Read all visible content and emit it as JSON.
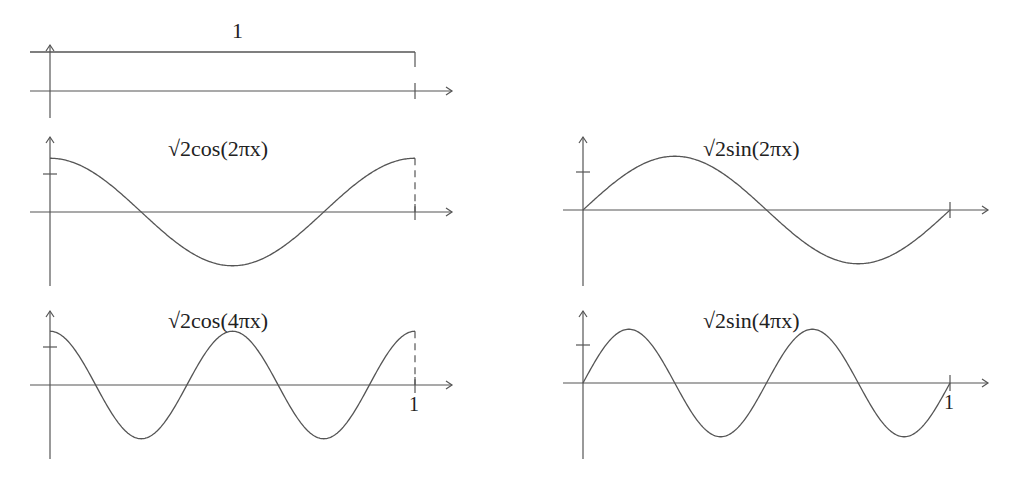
{
  "chart_data": [
    {
      "type": "line",
      "title": "1",
      "function": "constant",
      "amp": 1,
      "freq": 0,
      "trig": "const",
      "xlim": [
        0,
        1
      ],
      "ylim": [
        -0.5,
        1
      ],
      "layout": {
        "x0": 50,
        "x1": 415,
        "axisY": 91,
        "unit": 39,
        "arrowEnd": 452,
        "yTop": 45,
        "yBot": 118,
        "tickY": false,
        "label1": false,
        "titleX": 232,
        "titleY": 18
      }
    },
    {
      "type": "line",
      "title": "√2cos(2πx)",
      "function": "sqrt2*cos(2*pi*x)",
      "amp": 1.4142,
      "freq": 2,
      "trig": "cos",
      "xlim": [
        0,
        1
      ],
      "ylim": [
        -1.5,
        1.5
      ],
      "layout": {
        "x0": 50,
        "x1": 415,
        "axisY": 212,
        "unit": 38,
        "arrowEnd": 452,
        "yTop": 137,
        "yBot": 286,
        "tickY": true,
        "label1": false,
        "titleX": 168,
        "titleY": 136
      }
    },
    {
      "type": "line",
      "title": "√2sin(2πx)",
      "function": "sqrt2*sin(2*pi*x)",
      "amp": 1.4142,
      "freq": 2,
      "trig": "sin",
      "xlim": [
        0,
        1
      ],
      "ylim": [
        -1.5,
        1.5
      ],
      "layout": {
        "x0": 583,
        "x1": 950,
        "axisY": 210,
        "unit": 38,
        "arrowEnd": 988,
        "yTop": 137,
        "yBot": 286,
        "tickY": true,
        "label1": false,
        "titleX": 703,
        "titleY": 136
      }
    },
    {
      "type": "line",
      "title": "√2cos(4πx)",
      "function": "sqrt2*cos(4*pi*x)",
      "amp": 1.4142,
      "freq": 4,
      "trig": "cos",
      "xlim": [
        0,
        1
      ],
      "ylim": [
        -1.5,
        1.5
      ],
      "layout": {
        "x0": 50,
        "x1": 415,
        "axisY": 385,
        "unit": 38,
        "arrowEnd": 452,
        "yTop": 311,
        "yBot": 459,
        "tickY": true,
        "label1": true,
        "titleX": 168,
        "titleY": 308
      }
    },
    {
      "type": "line",
      "title": "√2sin(4πx)",
      "function": "sqrt2*sin(4*pi*x)",
      "amp": 1.4142,
      "freq": 4,
      "trig": "sin",
      "xlim": [
        0,
        1
      ],
      "ylim": [
        -1.5,
        1.5
      ],
      "layout": {
        "x0": 583,
        "x1": 950,
        "axisY": 383,
        "unit": 38,
        "arrowEnd": 988,
        "yTop": 311,
        "yBot": 459,
        "tickY": true,
        "label1": true,
        "titleX": 703,
        "titleY": 308
      }
    }
  ],
  "tick_label": "1",
  "stroke": "#555555"
}
